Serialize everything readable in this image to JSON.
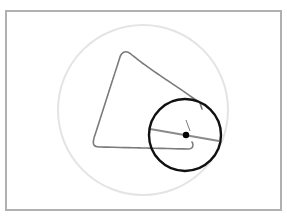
{
  "diagram": {
    "colors": {
      "background": "#ffffff",
      "frame": "#b0b0b0",
      "fixed_circle": "#e4e4e4",
      "traced_curve": "#7a7a7a",
      "rolling_circle": "#111111",
      "diameter_line": "#8a8a8a",
      "center_dot": "#000000"
    },
    "frame": {
      "x": 6,
      "y": 11,
      "width": 275,
      "height": 199
    },
    "fixed_circle": {
      "cx": 143,
      "cy": 110,
      "r": 85
    },
    "rolling_circle": {
      "cx": 185,
      "cy": 135,
      "r": 36
    },
    "diameter_line": {
      "x1": 150,
      "y1": 129,
      "x2": 219,
      "y2": 141
    },
    "center_dot": {
      "cx": 186,
      "cy": 135,
      "r": 3.2
    },
    "pen_arm": {
      "x1": 186,
      "y1": 120,
      "x2": 190,
      "y2": 131
    },
    "traced_curve_path": "M 202 109 L 200 103 C 180 88 150 70 132 55 C 127 50 122 51 120 57 L 94 138 C 92 145 94 147 100 147 L 188 149 C 193 149 194 145 192 142"
  }
}
